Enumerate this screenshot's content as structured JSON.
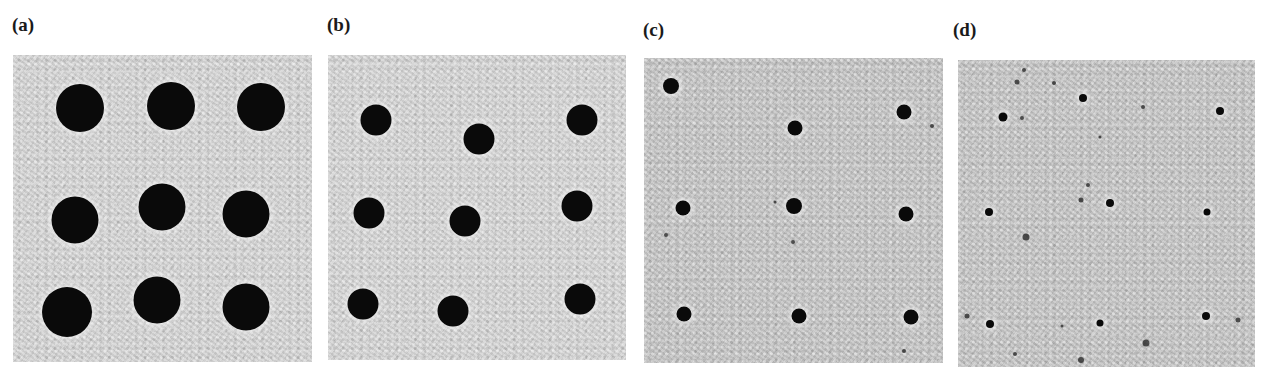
{
  "figure": {
    "panels": [
      {
        "label": "(a)",
        "description": "3x3 array of large dark circular holes",
        "label_pos": {
          "x": 12,
          "y": 15
        },
        "box": {
          "x": 13,
          "y": 55,
          "w": 299,
          "h": 307
        },
        "tone": "light",
        "dots": [
          {
            "x": 80,
            "y": 108,
            "d": 48
          },
          {
            "x": 171,
            "y": 106,
            "d": 48
          },
          {
            "x": 261,
            "y": 107,
            "d": 48
          },
          {
            "x": 75,
            "y": 220,
            "d": 47
          },
          {
            "x": 162,
            "y": 207,
            "d": 47
          },
          {
            "x": 246,
            "y": 214,
            "d": 47
          },
          {
            "x": 67,
            "y": 312,
            "d": 50
          },
          {
            "x": 157,
            "y": 300,
            "d": 47
          },
          {
            "x": 246,
            "y": 307,
            "d": 47
          }
        ],
        "specks": []
      },
      {
        "label": "(b)",
        "description": "3x3 array of medium dark circular holes, slightly irregular placement",
        "label_pos": {
          "x": 327,
          "y": 15
        },
        "box": {
          "x": 328,
          "y": 55,
          "w": 298,
          "h": 305
        },
        "tone": "light",
        "dots": [
          {
            "x": 376,
            "y": 120,
            "d": 31
          },
          {
            "x": 479,
            "y": 139,
            "d": 31
          },
          {
            "x": 582,
            "y": 120,
            "d": 31
          },
          {
            "x": 369,
            "y": 213,
            "d": 31
          },
          {
            "x": 465,
            "y": 221,
            "d": 31
          },
          {
            "x": 577,
            "y": 206,
            "d": 31
          },
          {
            "x": 363,
            "y": 304,
            "d": 31
          },
          {
            "x": 453,
            "y": 311,
            "d": 31
          },
          {
            "x": 580,
            "y": 299,
            "d": 31
          }
        ],
        "specks": []
      },
      {
        "label": "(c)",
        "description": "3x3 array of small dark holes with halos and scattered specks",
        "label_pos": {
          "x": 643,
          "y": 20
        },
        "box": {
          "x": 644,
          "y": 58,
          "w": 299,
          "h": 305
        },
        "tone": "mid",
        "dots": [
          {
            "x": 671,
            "y": 86,
            "d": 16
          },
          {
            "x": 795,
            "y": 128,
            "d": 15
          },
          {
            "x": 904,
            "y": 112,
            "d": 15
          },
          {
            "x": 683,
            "y": 208,
            "d": 15
          },
          {
            "x": 794,
            "y": 206,
            "d": 16
          },
          {
            "x": 906,
            "y": 214,
            "d": 15
          },
          {
            "x": 684,
            "y": 314,
            "d": 15
          },
          {
            "x": 799,
            "y": 316,
            "d": 15
          },
          {
            "x": 911,
            "y": 317,
            "d": 15
          }
        ],
        "specks": [
          {
            "x": 932,
            "y": 126,
            "d": 4
          },
          {
            "x": 666,
            "y": 235,
            "d": 4
          },
          {
            "x": 793,
            "y": 242,
            "d": 4
          },
          {
            "x": 775,
            "y": 202,
            "d": 3
          },
          {
            "x": 904,
            "y": 351,
            "d": 4
          }
        ]
      },
      {
        "label": "(d)",
        "description": "irregular tiny dark holes and defects scattered across the field",
        "label_pos": {
          "x": 953,
          "y": 20
        },
        "box": {
          "x": 958,
          "y": 60,
          "w": 297,
          "h": 307
        },
        "tone": "mid",
        "dots": [
          {
            "x": 1003,
            "y": 117,
            "d": 9
          },
          {
            "x": 1083,
            "y": 98,
            "d": 8
          },
          {
            "x": 1220,
            "y": 111,
            "d": 8
          },
          {
            "x": 989,
            "y": 212,
            "d": 8
          },
          {
            "x": 1110,
            "y": 203,
            "d": 8
          },
          {
            "x": 1207,
            "y": 212,
            "d": 7
          },
          {
            "x": 990,
            "y": 324,
            "d": 8
          },
          {
            "x": 1100,
            "y": 323,
            "d": 7
          },
          {
            "x": 1206,
            "y": 316,
            "d": 8
          }
        ],
        "specks": [
          {
            "x": 1024,
            "y": 70,
            "d": 4
          },
          {
            "x": 1017,
            "y": 82,
            "d": 5
          },
          {
            "x": 1054,
            "y": 83,
            "d": 4
          },
          {
            "x": 1022,
            "y": 118,
            "d": 4
          },
          {
            "x": 1143,
            "y": 107,
            "d": 4
          },
          {
            "x": 1100,
            "y": 137,
            "d": 3
          },
          {
            "x": 1088,
            "y": 185,
            "d": 4
          },
          {
            "x": 1081,
            "y": 200,
            "d": 5
          },
          {
            "x": 1026,
            "y": 237,
            "d": 7
          },
          {
            "x": 967,
            "y": 316,
            "d": 5
          },
          {
            "x": 1238,
            "y": 320,
            "d": 5
          },
          {
            "x": 1146,
            "y": 343,
            "d": 7
          },
          {
            "x": 1081,
            "y": 360,
            "d": 6
          },
          {
            "x": 1015,
            "y": 354,
            "d": 4
          },
          {
            "x": 1062,
            "y": 326,
            "d": 3
          }
        ]
      }
    ]
  }
}
